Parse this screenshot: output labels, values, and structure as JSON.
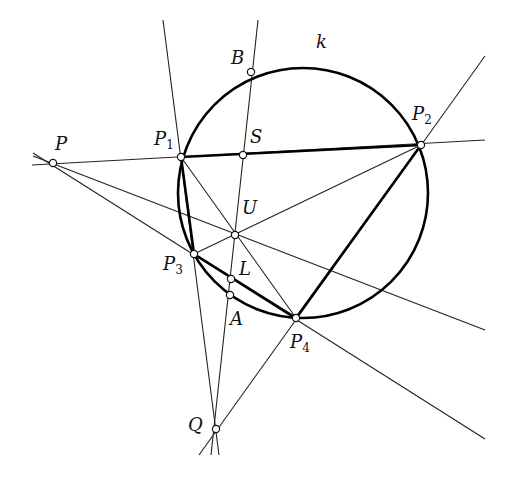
{
  "figure": {
    "type": "projective-geometry-construction",
    "circle": {
      "label": "k",
      "cx": 303,
      "cy": 193,
      "r": 125
    },
    "points": {
      "P": {
        "label": "P",
        "sub": "",
        "x": 53,
        "y": 163,
        "lx": 55,
        "ly": 150
      },
      "P1": {
        "label": "P",
        "sub": "1",
        "x": 181,
        "y": 157,
        "lx": 154,
        "ly": 145
      },
      "P2": {
        "label": "P",
        "sub": "2",
        "x": 421,
        "y": 145,
        "lx": 412,
        "ly": 120
      },
      "P3": {
        "label": "P",
        "sub": "3",
        "x": 194,
        "y": 254,
        "lx": 163,
        "ly": 270
      },
      "P4": {
        "label": "P",
        "sub": "4",
        "x": 296,
        "y": 318,
        "lx": 290,
        "ly": 348
      },
      "B": {
        "label": "B",
        "sub": "",
        "x": 251,
        "y": 72,
        "lx": 231,
        "ly": 64
      },
      "S": {
        "label": "S",
        "sub": "",
        "x": 243,
        "y": 155,
        "lx": 250,
        "ly": 143
      },
      "U": {
        "label": "U",
        "sub": "",
        "x": 235,
        "y": 235,
        "lx": 242,
        "ly": 214
      },
      "L": {
        "label": "L",
        "sub": "",
        "x": 231,
        "y": 279,
        "lx": 239,
        "ly": 275
      },
      "A": {
        "label": "A",
        "sub": "",
        "x": 230,
        "y": 295,
        "lx": 230,
        "ly": 325
      },
      "Q": {
        "label": "Q",
        "sub": "",
        "x": 216,
        "y": 429,
        "lx": 188,
        "ly": 431
      }
    },
    "thick_segments": [
      [
        "P1",
        "P2"
      ],
      [
        "P2",
        "P4"
      ],
      [
        "P3",
        "P4"
      ],
      [
        "P1",
        "P3"
      ]
    ],
    "thin_lines": [
      {
        "name": "line-P-P2",
        "x1": 32,
        "y1": 165,
        "x2": 485,
        "y2": 140
      },
      {
        "name": "line-P-P4",
        "x1": 33,
        "y1": 153,
        "x2": 485,
        "y2": 439
      },
      {
        "name": "line-P-U",
        "x1": 33,
        "y1": 156,
        "x2": 485,
        "y2": 330
      },
      {
        "name": "line-Q-B",
        "x1": 211,
        "y1": 455,
        "x2": 258,
        "y2": 20
      },
      {
        "name": "line-Q-P1",
        "x1": 219,
        "y1": 455,
        "x2": 163,
        "y2": 20
      },
      {
        "name": "line-Q-P2",
        "x1": 199,
        "y1": 455,
        "x2": 485,
        "y2": 56
      },
      {
        "name": "line-P1-P4",
        "x1": 181,
        "y1": 157,
        "x2": 296,
        "y2": 318
      },
      {
        "name": "line-P3-P2",
        "x1": 194,
        "y1": 254,
        "x2": 421,
        "y2": 145
      }
    ],
    "top_cut_text": "g"
  }
}
